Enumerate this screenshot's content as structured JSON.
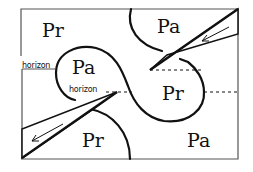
{
  "diagram": {
    "type": "phase-region diagram",
    "regions": [
      {
        "id": "top-left",
        "label": "Pr"
      },
      {
        "id": "top-right",
        "label": "Pa"
      },
      {
        "id": "center-left",
        "label": "Pa"
      },
      {
        "id": "center-right",
        "label": "Pr"
      },
      {
        "id": "bottom-left",
        "label": "Pr"
      },
      {
        "id": "bottom-right",
        "label": "Pa"
      }
    ],
    "horizon_labels": [
      {
        "id": "outer",
        "text": "horizon"
      },
      {
        "id": "inner",
        "text": "horizon"
      }
    ],
    "wedges": [
      {
        "id": "upper-right-wedge",
        "arrow_direction": "down-left"
      },
      {
        "id": "lower-left-wedge",
        "arrow_direction": "down-left"
      }
    ],
    "colors": {
      "stroke": "#111111",
      "background": "#ffffff",
      "frame": "#555555"
    }
  }
}
